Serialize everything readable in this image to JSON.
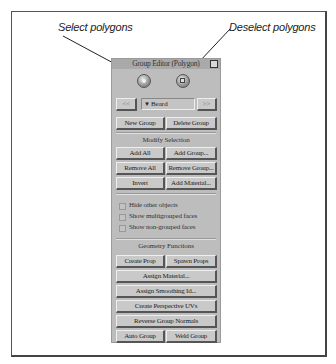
{
  "callouts": {
    "select": "Select polygons",
    "deselect": "Deselect polygons"
  },
  "panel": {
    "title": "Group Editor (Polygon)",
    "select_button_icon": "circle-select-icon",
    "deselect_button_icon": "square-deselect-icon",
    "nav": {
      "prev_label": "<<",
      "next_label": ">>",
      "current_group": "Beard"
    },
    "group_buttons": {
      "new": "New Group",
      "delete": "Delete Group"
    },
    "modify_selection": {
      "heading": "Modify Selection",
      "buttons": [
        [
          "Add All",
          "Add Group..."
        ],
        [
          "Remove All",
          "Remove Group..."
        ],
        [
          "Invert",
          "Add Material..."
        ]
      ]
    },
    "options": [
      {
        "label": "Hide other objects",
        "checked": false
      },
      {
        "label": "Show multigrouped faces",
        "checked": false
      },
      {
        "label": "Show non-grouped faces",
        "checked": false
      }
    ],
    "geometry_functions": {
      "heading": "Geometry Functions",
      "create_prop": "Create Prop",
      "spawn_props": "Spawn Props",
      "assign_material": "Assign Material...",
      "assign_smoothing_id": "Assign Smoothing Id...",
      "create_perspective_uvs": "Create Perspective UVs",
      "reverse_group_normals": "Reverse Group Normals",
      "auto_group": "Auto Group",
      "weld_group": "Weld Group"
    }
  }
}
